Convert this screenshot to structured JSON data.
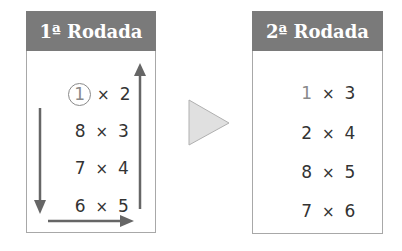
{
  "round1": {
    "title": "1ª Rodada",
    "rows": [
      {
        "a": "1",
        "op": "×",
        "b": "2",
        "a_circled": true
      },
      {
        "a": "8",
        "op": "×",
        "b": "3"
      },
      {
        "a": "7",
        "op": "×",
        "b": "4"
      },
      {
        "a": "6",
        "op": "×",
        "b": "5"
      }
    ],
    "arrows": [
      "arrow-down-left",
      "arrow-right-bottom",
      "arrow-up-right"
    ]
  },
  "transition": {
    "icon": "play-triangle-icon"
  },
  "round2": {
    "title": "2ª Rodada",
    "rows": [
      {
        "a": "1",
        "op": "×",
        "b": "3",
        "a_highlight": true
      },
      {
        "a": "2",
        "op": "×",
        "b": "4"
      },
      {
        "a": "8",
        "op": "×",
        "b": "5"
      },
      {
        "a": "7",
        "op": "×",
        "b": "6"
      }
    ]
  },
  "colors": {
    "header_bg": "#7a7a7a",
    "header_text": "#ffffff",
    "border": "#a8a8a8",
    "arrow": "#666666",
    "triangle_fill": "#e0e0e0",
    "text": "#333333"
  }
}
